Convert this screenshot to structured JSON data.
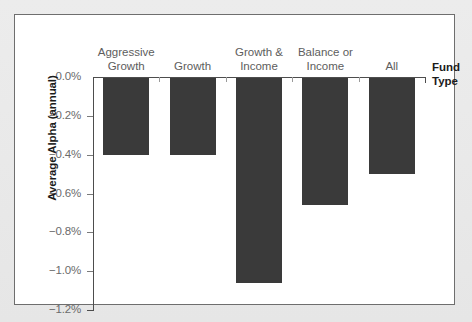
{
  "chart_data": {
    "type": "bar",
    "title": "",
    "xlabel": "Fund Type",
    "ylabel": "Average Alpha (annual)",
    "categories": [
      "Aggressive Growth",
      "Growth",
      "Growth & Income",
      "Balance or Income",
      "All"
    ],
    "category_labels": [
      "Aggressive\nGrowth",
      "Growth",
      "Growth &\nIncome",
      "Balance or\nIncome",
      "All"
    ],
    "values": [
      -0.4,
      -0.4,
      -1.06,
      -0.66,
      -0.5
    ],
    "ylim": [
      -1.2,
      0.0
    ],
    "yticks": [
      0.0,
      -0.2,
      -0.4,
      -0.6,
      -0.8,
      -1.0,
      -1.2
    ],
    "ytick_labels": [
      "−0.0%",
      "−0.2%",
      "−0.4%",
      "−0.6%",
      "−0.8%",
      "−1.0%",
      "−1.2%"
    ],
    "grid": false,
    "legend": "none",
    "bar_color": "#3a3a3a",
    "axis_color": "#4d4d4d",
    "panel_background": "#ffffff",
    "figure_background": "#e9e9e9"
  }
}
